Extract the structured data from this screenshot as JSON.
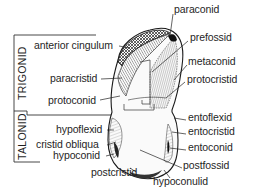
{
  "diagram": {
    "regions": [
      {
        "id": "trigonid",
        "label": "TRIGONID"
      },
      {
        "id": "talonid",
        "label": "TALONID"
      }
    ],
    "left_labels": [
      {
        "id": "anterior-cingulum",
        "text": "anterior cingulum"
      },
      {
        "id": "paracristid",
        "text": "paracristid"
      },
      {
        "id": "protoconid",
        "text": "protoconid"
      },
      {
        "id": "hypoflexid",
        "text": "hypoflexid"
      },
      {
        "id": "cristid-obliqua",
        "text": "cristid obliqua"
      },
      {
        "id": "hypoconid",
        "text": "hypoconid"
      },
      {
        "id": "postcristid",
        "text": "postcristid"
      }
    ],
    "right_labels": [
      {
        "id": "paraconid",
        "text": "paraconid"
      },
      {
        "id": "prefossid",
        "text": "prefossid"
      },
      {
        "id": "metaconid",
        "text": "metaconid"
      },
      {
        "id": "protocristid",
        "text": "protocristid"
      },
      {
        "id": "entoflexid",
        "text": "entoflexid"
      },
      {
        "id": "entocristid",
        "text": "entocristid"
      },
      {
        "id": "entoconid",
        "text": "entoconid"
      },
      {
        "id": "postfossid",
        "text": "postfossid"
      },
      {
        "id": "hypoconulid",
        "text": "hypoconulid"
      }
    ]
  }
}
